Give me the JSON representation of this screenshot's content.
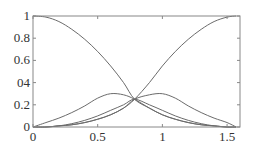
{
  "chart_data": {
    "type": "line",
    "title": "",
    "xlabel": "",
    "ylabel": "",
    "xlim": [
      0,
      1.6
    ],
    "ylim": [
      0,
      1
    ],
    "grid": false,
    "legend": null,
    "x_ticks": [
      "0",
      "0.5",
      "1",
      "1.5"
    ],
    "y_ticks": [
      "0",
      "0.2",
      "04",
      "0.6",
      "0.8",
      "1"
    ],
    "x": [
      0,
      0.1,
      0.2,
      0.3,
      0.4,
      0.5,
      0.6,
      0.7,
      0.785,
      0.9,
      1.0,
      1.1,
      1.2,
      1.3,
      1.4,
      1.5,
      1.57
    ],
    "series": [
      {
        "name": "decreasing",
        "values": [
          1.0,
          0.99,
          0.95,
          0.88,
          0.79,
          0.68,
          0.55,
          0.4,
          0.25,
          0.17,
          0.11,
          0.07,
          0.04,
          0.02,
          0.01,
          0.0,
          0.0
        ]
      },
      {
        "name": "increasing",
        "values": [
          0.0,
          0.0,
          0.01,
          0.02,
          0.04,
          0.07,
          0.11,
          0.17,
          0.25,
          0.4,
          0.55,
          0.68,
          0.79,
          0.88,
          0.95,
          0.99,
          1.0
        ]
      },
      {
        "name": "bump-left",
        "values": [
          0.0,
          0.04,
          0.08,
          0.13,
          0.19,
          0.26,
          0.3,
          0.29,
          0.25,
          0.17,
          0.11,
          0.07,
          0.04,
          0.02,
          0.01,
          0.0,
          0.0
        ]
      },
      {
        "name": "bump-right",
        "values": [
          0.0,
          0.0,
          0.01,
          0.02,
          0.04,
          0.07,
          0.11,
          0.17,
          0.25,
          0.29,
          0.3,
          0.26,
          0.19,
          0.13,
          0.08,
          0.04,
          0.0
        ]
      },
      {
        "name": "low-middle",
        "values": [
          0.0,
          0.0,
          0.01,
          0.03,
          0.06,
          0.1,
          0.15,
          0.2,
          0.25,
          0.2,
          0.15,
          0.1,
          0.06,
          0.03,
          0.01,
          0.0,
          0.0
        ]
      }
    ],
    "line_color": "#6b6b6b",
    "frame_color": "#888888"
  }
}
